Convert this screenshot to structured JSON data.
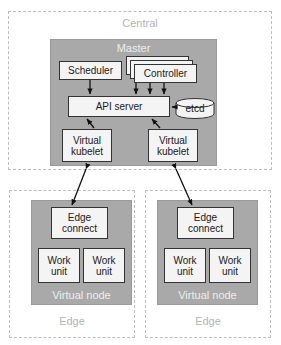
{
  "diagram": {
    "colors": {
      "gray_fill": "#a9a9a9",
      "box_fill": "#f4f4f4",
      "box_stroke": "#333333",
      "dashed_stroke": "#bdbdbd",
      "group_label": "#b4b4b4",
      "gray_label": "#ededed",
      "background": "#ffffff"
    },
    "groups": {
      "central": {
        "label": "Central"
      },
      "edge_left": {
        "label": "Edge"
      },
      "edge_right": {
        "label": "Edge"
      }
    },
    "containers": {
      "master": {
        "label": "Master"
      },
      "virtual_node_left": {
        "label": "Virtual node"
      },
      "virtual_node_right": {
        "label": "Virtual node"
      }
    },
    "nodes": {
      "scheduler": {
        "label": "Scheduler"
      },
      "controller": {
        "label": "Controller"
      },
      "api_server": {
        "label": "API server"
      },
      "etcd": {
        "label": "etcd"
      },
      "virtual_kubelet_left": {
        "line1": "Virtual",
        "line2": "kubelet"
      },
      "virtual_kubelet_right": {
        "line1": "Virtual",
        "line2": "kubelet"
      },
      "edge_connect_left": {
        "line1": "Edge",
        "line2": "connect"
      },
      "edge_connect_right": {
        "line1": "Edge",
        "line2": "connect"
      },
      "work_unit_left_1": {
        "line1": "Work",
        "line2": "unit"
      },
      "work_unit_left_2": {
        "line1": "Work",
        "line2": "unit"
      },
      "work_unit_right_1": {
        "line1": "Work",
        "line2": "unit"
      },
      "work_unit_right_2": {
        "line1": "Work",
        "line2": "unit"
      }
    }
  }
}
